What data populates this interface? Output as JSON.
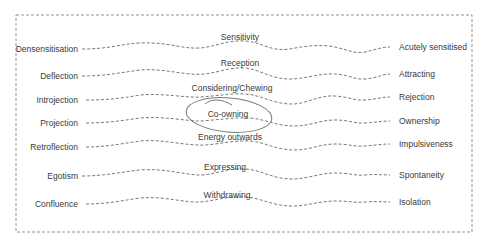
{
  "diagram": {
    "rows": [
      {
        "left": "Densensitisation",
        "center": "Sensitivity",
        "right": "Acutely sensitised",
        "y": 49,
        "cy": 37
      },
      {
        "left": "Deflection",
        "center": "Reception",
        "right": "Attracting",
        "y": 76,
        "cy": 63
      },
      {
        "left": "Introjection",
        "center": "Considering/Chewing",
        "right": "Rejection",
        "y": 100,
        "cy": 88
      },
      {
        "left": "Projection",
        "center": "Co-owning",
        "right": "Ownership",
        "y": 123,
        "cy": 114
      },
      {
        "left": "Retroflection",
        "center": "Energy outwards",
        "right": "Impulsiveness",
        "y": 147,
        "cy": 137
      },
      {
        "left": "Egotism",
        "center": "Expressing",
        "right": "Spontaneity",
        "y": 176,
        "cy": 167
      },
      {
        "left": "Confluence",
        "center": "Withdrawing",
        "right": "Isolation",
        "y": 204,
        "cy": 195
      }
    ],
    "highlight": "Co-owning",
    "colors": {
      "line": "#555555",
      "border": "#666666",
      "ellipse": "#777777"
    }
  }
}
